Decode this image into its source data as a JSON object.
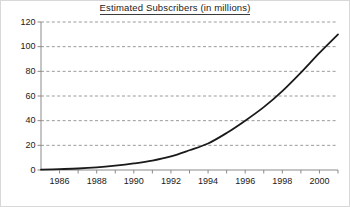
{
  "chart_data": {
    "type": "line",
    "title": "Estimated Subscribers (in millions)",
    "xlabel": "",
    "ylabel": "",
    "xlim": [
      1985.0,
      2001.0
    ],
    "ylim": [
      0,
      120
    ],
    "grid": true,
    "grid_axis": "y",
    "grid_style": "dashed",
    "legend": false,
    "legend_position": "none",
    "y_ticks": [
      0,
      20,
      40,
      60,
      80,
      100,
      120
    ],
    "y_tick_labels": [
      "0",
      "20",
      "40",
      "60",
      "80",
      "100",
      "120"
    ],
    "x_ticks": [
      1985,
      1986,
      1987,
      1988,
      1989,
      1990,
      1991,
      1992,
      1993,
      1994,
      1995,
      1996,
      1997,
      1998,
      1999,
      2000,
      2001
    ],
    "x_tick_labels_shown": [
      "1986",
      "1988",
      "1990",
      "1992",
      "1994",
      "1996",
      "1998",
      "2000"
    ],
    "x_labeled_ticks": [
      1986,
      1988,
      1990,
      1992,
      1994,
      1996,
      1998,
      2000
    ],
    "series": [
      {
        "name": "Estimated Subscribers",
        "color": "#1a1a1a",
        "line_width": 1.8,
        "x": [
          1985,
          1986,
          1987,
          1988,
          1989,
          1990,
          1991,
          1992,
          1993,
          1994,
          1995,
          1996,
          1997,
          1998,
          1999,
          2000,
          2001
        ],
        "values": [
          0.3,
          0.7,
          1.2,
          2.1,
          3.5,
          5.3,
          7.6,
          11.0,
          16.0,
          21.5,
          30.0,
          40.0,
          51.0,
          64.0,
          79.0,
          95.0,
          110.0
        ]
      }
    ],
    "annotations": []
  },
  "axes_style": {
    "axis_color": "#8a8a8a",
    "gridline_color": "#9a9a9a",
    "curve_color": "#1a1a1a",
    "text_color": "#1a1a1a",
    "background": "#ffffff",
    "frame_color": "#d8d8d8"
  }
}
